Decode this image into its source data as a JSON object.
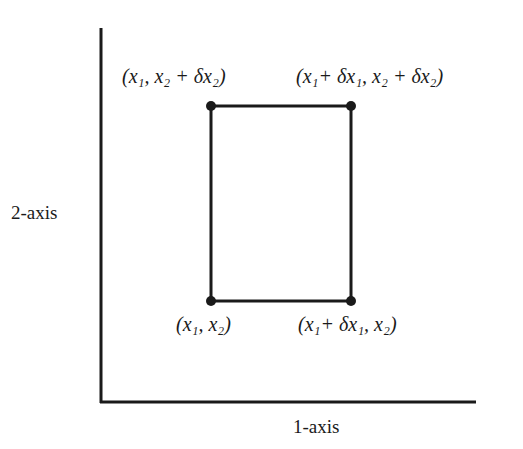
{
  "diagram": {
    "axes": {
      "x_label": "1-axis",
      "y_label": "2-axis"
    },
    "rectangle": {
      "corners": [
        {
          "id": "bottom-left",
          "label": "(x₁, x₂)"
        },
        {
          "id": "bottom-right",
          "label": "(x₁+ δx₁, x₂)"
        },
        {
          "id": "top-left",
          "label": "(x₁, x₂ + δx₂)"
        },
        {
          "id": "top-right",
          "label": "(x₁+ δx₁, x₂ + δx₂)"
        }
      ]
    },
    "colors": {
      "line": "#1a1a1a",
      "background": "#ffffff"
    }
  }
}
